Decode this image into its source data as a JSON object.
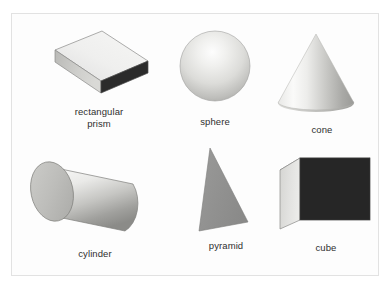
{
  "figure": {
    "background_color": "#fdfdfd",
    "border_color": "#e2e2e2",
    "label_color": "#2f2f2f",
    "shapes": [
      {
        "id": "rectangular-prism",
        "label": "rectangular\nprism",
        "kind": "rectangular prism",
        "row": 1,
        "column": 1,
        "top_face_color": "#ececeb",
        "front_face_color": "#2b2b2b",
        "side_face_color": "#c8c8c6",
        "outline_color": "#6d6d6d"
      },
      {
        "id": "sphere",
        "label": "sphere",
        "kind": "sphere",
        "row": 1,
        "column": 2,
        "highlight_color": "#fbfbfa",
        "mid_color": "#d6d6d3",
        "shade_color": "#a8a8a5",
        "outline_color": "#9a9a97"
      },
      {
        "id": "cone",
        "label": "cone",
        "kind": "cone",
        "row": 1,
        "column": 3,
        "highlight_color": "#f4f4f3",
        "mid_color": "#d0d0cd",
        "shade_color": "#9d9d9a",
        "outline_color": "#b4b4b1"
      },
      {
        "id": "cylinder",
        "label": "cylinder",
        "kind": "cylinder",
        "row": 2,
        "column": 1,
        "end_cap_color": "#bdbdba",
        "highlight_color": "#f2f2f1",
        "shade_color": "#8e8e8b",
        "outline_color": "#7c7c79"
      },
      {
        "id": "pyramid",
        "label": "pyramid",
        "kind": "pyramid",
        "row": 2,
        "column": 2,
        "face_color": "#919190",
        "outline_color": "#7d7d7c"
      },
      {
        "id": "cube",
        "label": "cube",
        "kind": "cube",
        "row": 2,
        "column": 3,
        "front_face_color": "#262626",
        "top_face_color": "#e4e4e2",
        "side_face_color": "#c6c6c3",
        "outline_color": "#6d6d6d"
      }
    ]
  }
}
